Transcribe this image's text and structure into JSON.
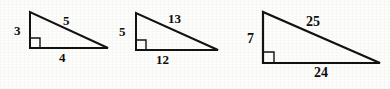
{
  "figure": {
    "background_color": "#fdfdfb",
    "stroke_color": "#111111",
    "label_color": "#0d0d0d"
  },
  "triangles": [
    {
      "name": "triangle-3-4-5",
      "vertical_leg_label": "3",
      "hypotenuse_label": "5",
      "horizontal_leg_label": "4",
      "right_angle_marker": "right-angle-square",
      "geometry": {
        "apex": [
          30,
          12
        ],
        "right_angle_vertex": [
          30,
          48
        ],
        "far_vertex": [
          108,
          48
        ],
        "stroke_width": 2.0,
        "marker_size": 10
      },
      "label_positions": {
        "vertical_leg": [
          14,
          24
        ],
        "hypotenuse": [
          63,
          14
        ],
        "horizontal_leg": [
          59,
          51
        ]
      }
    },
    {
      "name": "triangle-5-12-13",
      "vertical_leg_label": "5",
      "hypotenuse_label": "13",
      "horizontal_leg_label": "12",
      "right_angle_marker": "right-angle-square",
      "geometry": {
        "apex": [
          136,
          13
        ],
        "right_angle_vertex": [
          136,
          50
        ],
        "far_vertex": [
          218,
          50
        ],
        "stroke_width": 2.0,
        "marker_size": 10
      },
      "label_positions": {
        "vertical_leg": [
          119,
          25
        ],
        "hypotenuse": [
          168,
          12
        ],
        "horizontal_leg": [
          156,
          53
        ]
      }
    },
    {
      "name": "triangle-7-24-25",
      "vertical_leg_label": "7",
      "hypotenuse_label": "25",
      "horizontal_leg_label": "24",
      "right_angle_marker": "right-angle-square",
      "geometry": {
        "apex": [
          263,
          12
        ],
        "right_angle_vertex": [
          263,
          63
        ],
        "far_vertex": [
          380,
          63
        ],
        "stroke_width": 2.2,
        "marker_size": 11
      },
      "label_positions": {
        "vertical_leg": [
          247,
          32
        ],
        "hypotenuse": [
          306,
          15
        ],
        "horizontal_leg": [
          314,
          66
        ]
      }
    }
  ],
  "label_font_sizes": {
    "small": "13px",
    "medium": "13px",
    "large": "14px"
  }
}
